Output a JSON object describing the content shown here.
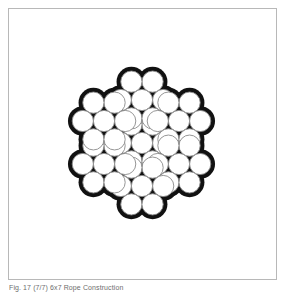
{
  "figure": {
    "caption": "Fig. 17 (7/7) 6x7 Rope Construction",
    "frame": {
      "border_color": "#b8b8b8",
      "background_color": "#ffffff"
    }
  },
  "chart_data": {
    "type": "diagram",
    "title": "Fig. 17 (7/7) 6x7 Rope Construction",
    "construction": "7x7",
    "strand_count": 7,
    "wires_per_strand": 7,
    "total_wires": 49,
    "colors": {
      "wire_fill": "#ffffff",
      "wire_stroke": "#8a8a8a",
      "core_fill": "#111111",
      "page": "#ffffff"
    },
    "geometry": {
      "canvas_width": 267,
      "canvas_height": 270,
      "center_x": 133,
      "center_y": 134,
      "wire_radius": 10.6,
      "wire_stroke_width": 0.9,
      "strand_pitch": 43.2,
      "strand_rotation_deg": 0,
      "wire_ring_rotation_deg": 0
    },
    "strands": [
      {
        "name": "core-strand",
        "position": "center",
        "angle_deg": null,
        "cx": 133,
        "cy": 134
      },
      {
        "name": "outer-strand-top",
        "position": "top",
        "angle_deg": 90,
        "cx": 133,
        "cy": 91
      },
      {
        "name": "outer-strand-upper-right",
        "position": "upper-right",
        "angle_deg": 30,
        "cx": 170,
        "cy": 112
      },
      {
        "name": "outer-strand-lower-right",
        "position": "lower-right",
        "angle_deg": -30,
        "cx": 170,
        "cy": 155
      },
      {
        "name": "outer-strand-bottom",
        "position": "bottom",
        "angle_deg": -90,
        "cx": 133,
        "cy": 177
      },
      {
        "name": "outer-strand-lower-left",
        "position": "lower-left",
        "angle_deg": -150,
        "cx": 95,
        "cy": 155
      },
      {
        "name": "outer-strand-upper-left",
        "position": "upper-left",
        "angle_deg": 150,
        "cx": 95,
        "cy": 112
      }
    ]
  }
}
